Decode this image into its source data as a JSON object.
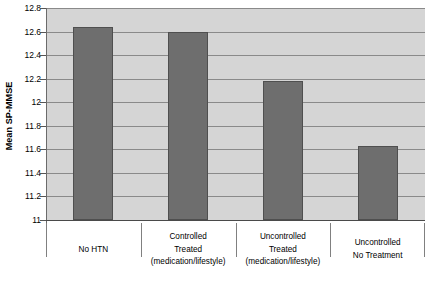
{
  "chart_data": {
    "type": "bar",
    "title": "",
    "xlabel": "",
    "ylabel": "Mean SP-MMSE",
    "ylim": [
      11,
      12.8
    ],
    "ytick_step": 0.2,
    "yticks": [
      "12.8",
      "12.6",
      "12.4",
      "12.2",
      "12",
      "11.8",
      "11.6",
      "11.4",
      "11.2",
      "11"
    ],
    "ytick_values": [
      12.8,
      12.6,
      12.4,
      12.2,
      12.0,
      11.8,
      11.6,
      11.4,
      11.2,
      11.0
    ],
    "grid": true,
    "legend": "none",
    "categories": [
      "No HTN",
      "Controlled Treated (medication/lifestyle)",
      "Uncontrolled Treated (medication/lifestyle)",
      "Uncontrolled No Treatment"
    ],
    "category_lines": [
      [
        "No HTN"
      ],
      [
        "Controlled",
        "Treated",
        "(medication/lifestyle)"
      ],
      [
        "Uncontrolled",
        "Treated",
        "(medication/lifestyle)"
      ],
      [
        "Uncontrolled",
        "No Treatment"
      ]
    ],
    "values": [
      12.64,
      12.6,
      12.18,
      11.63
    ],
    "bar_color": "#6e6e6e",
    "bar_edge_color": "#4f4f4f",
    "plot_background": "#d5d5d5",
    "gridline_color": "#8a8a8a",
    "axis_color": "#4a4a4a"
  }
}
